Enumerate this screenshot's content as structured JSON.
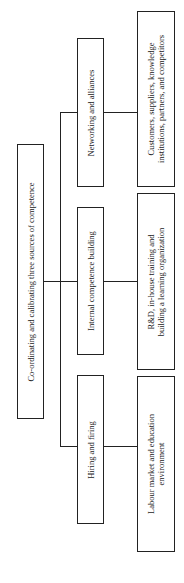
{
  "diagram": {
    "orientation": "rotated-90-ccw",
    "root": {
      "label": "Co-ordinating and calibrating three sources of competence"
    },
    "branches": [
      {
        "label": "Networking and alliances",
        "detail_line1": "Customers, suppliers, knowledge",
        "detail_line2": "institutions, partners, and competitors"
      },
      {
        "label": "Internal competence building",
        "detail_line1": "R&D, in-house training and",
        "detail_line2": "building a learning organization"
      },
      {
        "label": "Hiring and firing",
        "detail_line1": "Labour market and education",
        "detail_line2": "environment"
      }
    ]
  }
}
